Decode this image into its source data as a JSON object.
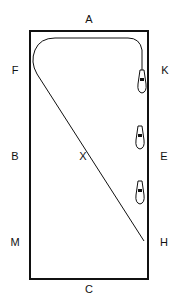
{
  "diagram": {
    "type": "dressage-arena",
    "stroke_color": "#111111",
    "background": "#ffffff",
    "markers": [
      {
        "id": "A",
        "label": "A",
        "x": 89,
        "y": 19
      },
      {
        "id": "F",
        "label": "F",
        "x": 15,
        "y": 70
      },
      {
        "id": "K",
        "label": "K",
        "x": 165,
        "y": 70
      },
      {
        "id": "B",
        "label": "B",
        "x": 15,
        "y": 156
      },
      {
        "id": "X",
        "label": "X",
        "x": 83,
        "y": 156
      },
      {
        "id": "E",
        "label": "E",
        "x": 164,
        "y": 156
      },
      {
        "id": "M",
        "label": "M",
        "x": 15,
        "y": 242
      },
      {
        "id": "H",
        "label": "H",
        "x": 164,
        "y": 242
      },
      {
        "id": "C",
        "label": "C",
        "x": 89,
        "y": 289
      }
    ],
    "horses": [
      {
        "id": "horse-1",
        "x": 142,
        "y": 80
      },
      {
        "id": "horse-2",
        "x": 140,
        "y": 136
      },
      {
        "id": "horse-3",
        "x": 140,
        "y": 191
      }
    ]
  }
}
